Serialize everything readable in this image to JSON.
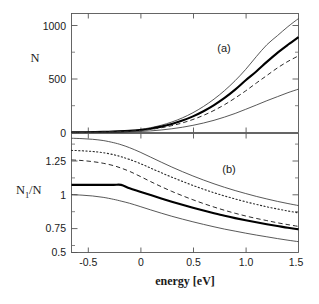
{
  "figure": {
    "width": 319,
    "height": 304,
    "background": "#ffffff",
    "ink_color": "#1a1a1a"
  },
  "chart_data": [
    {
      "type": "line",
      "panel": "a",
      "panel_label": "(a)",
      "title": "",
      "xlabel": "energy  [eV]",
      "ylabel": "N",
      "xlim": [
        -0.65,
        1.5
      ],
      "ylim": [
        0,
        1180
      ],
      "xticks": [
        -0.5,
        0,
        0.5,
        1.0,
        1.5
      ],
      "xticklabels": [
        "-0.5",
        "0",
        "0.5",
        "1.0",
        "1.5"
      ],
      "yticks": [
        0,
        500,
        1000
      ],
      "yticklabels": [
        "0",
        "500",
        "1000"
      ],
      "yminorticks": [
        250,
        750
      ],
      "grid": false,
      "legend": "none",
      "x": [
        -0.65,
        -0.5,
        -0.35,
        -0.2,
        -0.1,
        0.0,
        0.1,
        0.2,
        0.3,
        0.4,
        0.5,
        0.6,
        0.7,
        0.8,
        0.9,
        1.0,
        1.1,
        1.2,
        1.3,
        1.4,
        1.5
      ],
      "series": [
        {
          "name": "upper-envelope",
          "style": "thin-solid",
          "values": [
            2,
            4,
            8,
            14,
            20,
            30,
            48,
            72,
            104,
            145,
            196,
            258,
            331,
            416,
            514,
            626,
            752,
            870,
            960,
            1050,
            1130
          ]
        },
        {
          "name": "mean-thick",
          "style": "thick-solid",
          "values": [
            1,
            3,
            6,
            11,
            16,
            24,
            38,
            58,
            84,
            118,
            160,
            211,
            272,
            343,
            425,
            518,
            605,
            700,
            790,
            870,
            945
          ]
        },
        {
          "name": "model-dashed",
          "style": "dashed",
          "values": [
            1,
            2,
            5,
            9,
            13,
            20,
            31,
            47,
            68,
            95,
            129,
            170,
            219,
            276,
            342,
            413,
            490,
            565,
            640,
            705,
            760
          ]
        },
        {
          "name": "lower-envelope",
          "style": "thin-solid",
          "values": [
            0,
            1,
            2,
            4,
            6,
            10,
            16,
            25,
            37,
            52,
            71,
            94,
            121,
            153,
            189,
            230,
            272,
            315,
            355,
            395,
            430
          ]
        }
      ]
    },
    {
      "type": "line",
      "panel": "b",
      "panel_label": "(b)",
      "title": "",
      "xlabel": "energy  [eV]",
      "ylabel": "N1/N",
      "ylabel_base": "N",
      "ylabel_sub": "1",
      "ylabel_tail": "/N",
      "xlim": [
        -0.65,
        1.5
      ],
      "ylim": [
        0.5,
        1.38
      ],
      "xticks": [
        -0.5,
        0,
        0.5,
        1.0,
        1.5
      ],
      "xticklabels": [
        "-0.5",
        "0",
        "0.5",
        "1.0",
        "1.5"
      ],
      "yticks": [
        0.5,
        0.75,
        1,
        1.25
      ],
      "yticklabels": [
        "0.5",
        "0.75",
        "1",
        "1.25"
      ],
      "yminorticks": [
        0.625,
        0.875,
        1.125,
        1.375
      ],
      "grid": false,
      "legend": "none",
      "x": [
        -0.65,
        -0.55,
        -0.45,
        -0.35,
        -0.25,
        -0.18,
        -0.1,
        0.0,
        0.1,
        0.2,
        0.3,
        0.4,
        0.5,
        0.6,
        0.7,
        0.8,
        0.9,
        1.0,
        1.1,
        1.2,
        1.3,
        1.4,
        1.5
      ],
      "series": [
        {
          "name": "upper-envelope",
          "style": "thin-solid",
          "values": [
            1.345,
            1.342,
            1.337,
            1.328,
            1.312,
            1.297,
            1.275,
            1.242,
            1.205,
            1.168,
            1.132,
            1.098,
            1.066,
            1.036,
            1.008,
            0.982,
            0.958,
            0.936,
            0.915,
            0.896,
            0.878,
            0.862,
            0.847
          ]
        },
        {
          "name": "dotted-model",
          "style": "dotted",
          "values": [
            1.255,
            1.252,
            1.247,
            1.238,
            1.223,
            1.208,
            1.188,
            1.158,
            1.124,
            1.09,
            1.057,
            1.026,
            0.996,
            0.968,
            0.942,
            0.918,
            0.896,
            0.875,
            0.856,
            0.838,
            0.822,
            0.807,
            0.793
          ]
        },
        {
          "name": "dashed-model",
          "style": "dashed",
          "values": [
            1.185,
            1.18,
            1.172,
            1.16,
            1.142,
            1.124,
            1.1,
            1.063,
            1.024,
            0.987,
            0.952,
            0.92,
            0.89,
            0.862,
            0.836,
            0.812,
            0.79,
            0.77,
            0.752,
            0.736,
            0.72,
            0.706,
            0.693
          ]
        },
        {
          "name": "reference-thick",
          "style": "thick-solid",
          "values": [
            1.0,
            1.0,
            1.0,
            1.0,
            1.0,
            1.0,
            0.975,
            0.95,
            0.925,
            0.9,
            0.876,
            0.853,
            0.831,
            0.81,
            0.79,
            0.771,
            0.754,
            0.738,
            0.723,
            0.709,
            0.696,
            0.683,
            0.672
          ]
        },
        {
          "name": "lower-envelope",
          "style": "thin-solid",
          "values": [
            0.928,
            0.924,
            0.918,
            0.908,
            0.893,
            0.88,
            0.864,
            0.84,
            0.815,
            0.791,
            0.768,
            0.747,
            0.727,
            0.708,
            0.69,
            0.673,
            0.658,
            0.643,
            0.629,
            0.616,
            0.603,
            0.591,
            0.58
          ]
        }
      ]
    }
  ],
  "labels": {
    "panel_a": "(a)",
    "panel_b": "(b)",
    "xaxis_title": "energy  [eV]",
    "yaxis_a": "N",
    "yaxis_b_base": "N",
    "yaxis_b_sub": "1",
    "yaxis_b_tail": "/N",
    "xticks": [
      "-0.5",
      "0",
      "0.5",
      "1.0",
      "1.5"
    ],
    "yticks_a": [
      "1000",
      "500",
      "0"
    ],
    "yticks_b": [
      "1.25",
      "1",
      "0.75",
      "0.5"
    ]
  }
}
